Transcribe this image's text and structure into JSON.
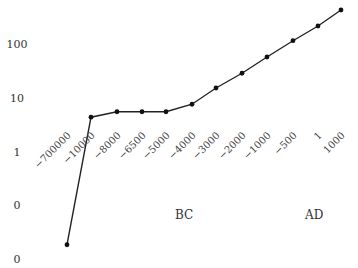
{
  "chart_data": {
    "type": "line",
    "title": "",
    "xlabel": "",
    "ylabel": "",
    "yscale": "log",
    "categories": [
      "−700000",
      "−10000",
      "−8000",
      "−6500",
      "−5000",
      "−4000",
      "−3000",
      "−2000",
      "−1000",
      "−500",
      "1",
      "1000"
    ],
    "series": [
      {
        "name": "series-1",
        "values": [
          0.02,
          4.6,
          5.8,
          5.8,
          5.8,
          8,
          16,
          30,
          60,
          120,
          225,
          445
        ]
      }
    ],
    "y_tick_labels": [
      "100",
      "10",
      "1",
      "0",
      "0"
    ],
    "y_tick_values": [
      100,
      10,
      1,
      0.1,
      0.01
    ],
    "era_labels": [
      "BC",
      "AD"
    ],
    "grid": false,
    "legend": "none",
    "line_color": "#222222",
    "marker_color": "#111111"
  }
}
